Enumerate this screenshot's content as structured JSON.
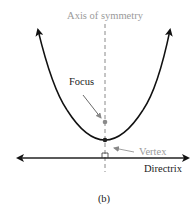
{
  "diagram": {
    "caption": "(b)",
    "labels": {
      "axis": "Axis of symmetry",
      "focus": "Focus",
      "vertex": "Vertex",
      "directrix": "Directrix"
    },
    "colors": {
      "curve": "#111111",
      "axis_label": "#9a9a9a",
      "vertex_label": "#9a9a9a",
      "focus_dot": "#8a8a8a",
      "text": "#1a1a1a"
    }
  }
}
